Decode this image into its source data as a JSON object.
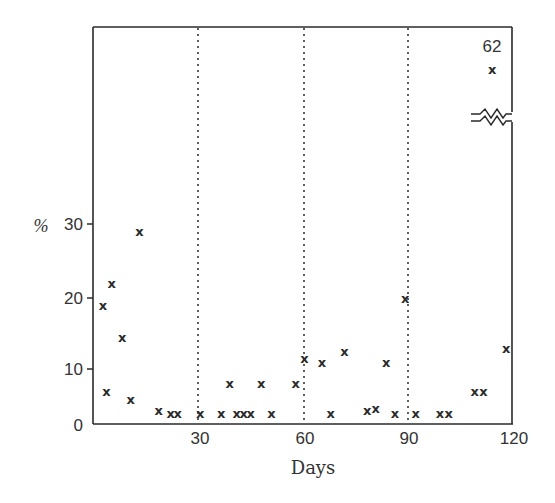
{
  "chart_data": {
    "type": "scatter",
    "title": "",
    "xlabel": "Days",
    "ylabel": "%",
    "xlim": [
      0,
      120
    ],
    "ylim": [
      0,
      30
    ],
    "x_ticks": [
      0,
      30,
      60,
      90,
      120
    ],
    "x_tick_labels": [
      "30",
      "60",
      "90",
      "120"
    ],
    "y_ticks": [
      0,
      10,
      20,
      30
    ],
    "y_tick_labels": [
      "0",
      "10",
      "20",
      "30"
    ],
    "grid": false,
    "vertical_reference_lines": [
      30,
      60,
      90
    ],
    "vertical_reference_style": "dotted",
    "axis_break": {
      "axis": "y",
      "location": "above 30, right side",
      "note": "broken axis for outlier"
    },
    "marker": "x",
    "outlier_annotation": "62",
    "legend": null,
    "series": [
      {
        "name": "observations",
        "points": [
          {
            "x": 2,
            "y": 19
          },
          {
            "x": 3,
            "y": 6
          },
          {
            "x": 4.5,
            "y": 22
          },
          {
            "x": 7.5,
            "y": 14.5
          },
          {
            "x": 10,
            "y": 4.5
          },
          {
            "x": 12.5,
            "y": 29
          },
          {
            "x": 18,
            "y": 2.5
          },
          {
            "x": 21.5,
            "y": 2
          },
          {
            "x": 23.5,
            "y": 2
          },
          {
            "x": 30,
            "y": 2
          },
          {
            "x": 36,
            "y": 2
          },
          {
            "x": 38.5,
            "y": 7.5
          },
          {
            "x": 40.5,
            "y": 2
          },
          {
            "x": 42.5,
            "y": 2
          },
          {
            "x": 44.5,
            "y": 2
          },
          {
            "x": 47.5,
            "y": 7.5
          },
          {
            "x": 50.5,
            "y": 2
          },
          {
            "x": 57.5,
            "y": 7.5
          },
          {
            "x": 60,
            "y": 11.5
          },
          {
            "x": 65,
            "y": 11
          },
          {
            "x": 67.5,
            "y": 2
          },
          {
            "x": 71.5,
            "y": 12.5
          },
          {
            "x": 78,
            "y": 2.5
          },
          {
            "x": 80.5,
            "y": 3
          },
          {
            "x": 83.5,
            "y": 11
          },
          {
            "x": 86,
            "y": 2
          },
          {
            "x": 89,
            "y": 20
          },
          {
            "x": 92,
            "y": 2
          },
          {
            "x": 99,
            "y": 2
          },
          {
            "x": 101.5,
            "y": 2
          },
          {
            "x": 109,
            "y": 6
          },
          {
            "x": 111.5,
            "y": 6
          },
          {
            "x": 114,
            "y": 62
          },
          {
            "x": 118,
            "y": 13
          }
        ]
      }
    ]
  },
  "labels": {
    "xlabel": "Days",
    "ylabel": "%",
    "outlier": "62",
    "y0": "0",
    "y10": "10",
    "y20": "20",
    "y30": "30",
    "x30": "30",
    "x60": "60",
    "x90": "90",
    "x120": "120"
  },
  "colors": {
    "ink": "#2a2a2a",
    "background": "#ffffff"
  }
}
